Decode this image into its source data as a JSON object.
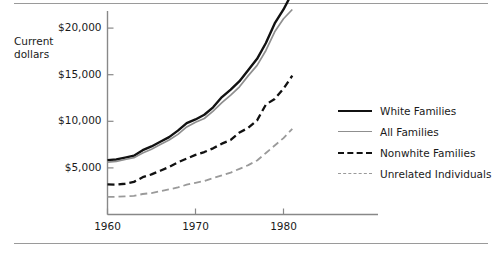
{
  "figure": {
    "axis_title": "Current\ndollars",
    "axis_title_line1": "Current",
    "axis_title_line2": "dollars"
  },
  "colors": {
    "white_families": "#111111",
    "all_families": "#8f8f8f",
    "nonwhite_families": "#111111",
    "unrelated_individuals": "#9a9a9a",
    "axis": "#888888",
    "rule": "#9a9a9a",
    "text": "#1a1a1a"
  },
  "legend": {
    "position": "right",
    "items": [
      {
        "label": "White Families",
        "style": "solid",
        "color": "#111111",
        "width": 2.4
      },
      {
        "label": "All Families",
        "style": "solid",
        "color": "#8f8f8f",
        "width": 1.8
      },
      {
        "label": "Nonwhite Families",
        "style": "dashed",
        "color": "#111111",
        "width": 2.4
      },
      {
        "label": "Unrelated Individuals",
        "style": "dashed",
        "color": "#9a9a9a",
        "width": 1.8
      }
    ]
  },
  "chart_data": {
    "type": "line",
    "title": "",
    "xlabel": "",
    "ylabel": "Current dollars",
    "xlim": [
      1959,
      1982
    ],
    "ylim": [
      0,
      25000
    ],
    "grid": false,
    "legend_position": "right",
    "xticks": [
      1960,
      1970,
      1980
    ],
    "xtick_labels": [
      "1960",
      "1970",
      "1980"
    ],
    "yticks": [
      5000,
      10000,
      15000,
      20000
    ],
    "ytick_labels": [
      "$5,000",
      "$10,000",
      "$15,000",
      "$20,000"
    ],
    "x": [
      1960,
      1961,
      1962,
      1963,
      1964,
      1965,
      1966,
      1967,
      1968,
      1969,
      1970,
      1971,
      1972,
      1973,
      1974,
      1975,
      1976,
      1977,
      1978,
      1979,
      1980,
      1981
    ],
    "series": [
      {
        "name": "White Families",
        "values": [
          5835,
          5900,
          6100,
          6300,
          6900,
          7300,
          7800,
          8300,
          9000,
          9800,
          10200,
          10700,
          11500,
          12600,
          13400,
          14300,
          15500,
          16700,
          18400,
          20500,
          22000,
          23800
        ]
      },
      {
        "name": "All Families",
        "values": [
          5620,
          5700,
          5900,
          6100,
          6600,
          7000,
          7500,
          8000,
          8600,
          9400,
          9900,
          10300,
          11100,
          12000,
          12800,
          13700,
          14900,
          16000,
          17600,
          19600,
          21000,
          22000
        ]
      },
      {
        "name": "Nonwhite Families",
        "values": [
          3230,
          3200,
          3300,
          3500,
          4000,
          4300,
          4700,
          5100,
          5600,
          6000,
          6400,
          6700,
          7100,
          7600,
          8000,
          8800,
          9300,
          10100,
          11800,
          12400,
          13500,
          14900
        ]
      },
      {
        "name": "Unrelated Individuals",
        "values": [
          1900,
          1900,
          1950,
          2000,
          2200,
          2300,
          2500,
          2700,
          2900,
          3200,
          3400,
          3600,
          3900,
          4200,
          4500,
          4900,
          5300,
          5800,
          6600,
          7400,
          8200,
          9200
        ]
      }
    ]
  }
}
